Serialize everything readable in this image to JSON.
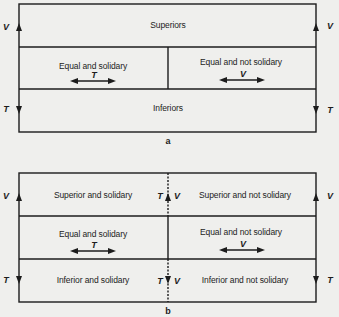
{
  "diagram_a": {
    "caption": "a",
    "top_row": {
      "label": "Superiors"
    },
    "middle_row": {
      "left": {
        "label": "Equal and solidary",
        "arrow_label": "T"
      },
      "right": {
        "label": "Equal and not solidary",
        "arrow_label": "V"
      }
    },
    "bottom_row": {
      "label": "Inferiors"
    },
    "left_axis": {
      "up_label": "V",
      "down_label": "T"
    },
    "right_axis": {
      "up_label": "V",
      "down_label": "T"
    }
  },
  "diagram_b": {
    "caption": "b",
    "top_row": {
      "left": {
        "label": "Superior and solidary"
      },
      "right": {
        "label": "Superior and not solidary"
      }
    },
    "middle_row": {
      "left": {
        "label": "Equal and solidary",
        "arrow_label": "T"
      },
      "right": {
        "label": "Equal and not solidary",
        "arrow_label": "V"
      }
    },
    "bottom_row": {
      "left": {
        "label": "Inferior and solidary"
      },
      "right": {
        "label": "Inferior and not solidary"
      }
    },
    "left_axis": {
      "up_label": "V",
      "down_label": "T"
    },
    "right_axis": {
      "up_label": "V",
      "down_label": "T"
    },
    "center_axis": {
      "up_left_label": "T",
      "up_right_label": "V",
      "down_left_label": "T",
      "down_right_label": "V"
    }
  },
  "colors": {
    "line": "#1c1c1c",
    "background": "#efefed"
  }
}
